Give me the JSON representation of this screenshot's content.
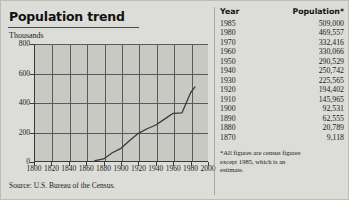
{
  "title": "Population trend",
  "source": "Source: U.S. Bureau of the Census.",
  "footnote": "*All figures are census figures except 1985, which is an estimate.",
  "table": {
    "headers": {
      "year": "Year",
      "population": "Population*"
    },
    "rows": [
      {
        "year": "1985",
        "population": "509,000"
      },
      {
        "year": "1980",
        "population": "469,557"
      },
      {
        "year": "1970",
        "population": "332,416"
      },
      {
        "year": "1960",
        "population": "330,066"
      },
      {
        "year": "1950",
        "population": "290,529"
      },
      {
        "year": "1940",
        "population": "250,742"
      },
      {
        "year": "1930",
        "population": "225,565"
      },
      {
        "year": "1920",
        "population": "194,402"
      },
      {
        "year": "1910",
        "population": "145,965"
      },
      {
        "year": "1900",
        "population": "92,531"
      },
      {
        "year": "1890",
        "population": "62,555"
      },
      {
        "year": "1880",
        "population": "20,789"
      },
      {
        "year": "1870",
        "population": "9,118"
      }
    ]
  },
  "chart_data": {
    "type": "line",
    "title": "Population trend",
    "xlabel": "",
    "ylabel": "Thousands",
    "xlim": [
      1800,
      2000
    ],
    "ylim": [
      0,
      800
    ],
    "xticks": [
      1800,
      1820,
      1840,
      1860,
      1880,
      1900,
      1920,
      1940,
      1960,
      1980,
      2000
    ],
    "yticks": [
      0,
      200,
      400,
      600,
      800
    ],
    "grid": true,
    "legend": false,
    "x": [
      1870,
      1880,
      1890,
      1900,
      1910,
      1920,
      1930,
      1940,
      1950,
      1960,
      1970,
      1980,
      1985
    ],
    "values": [
      9.118,
      20.789,
      62.555,
      92.531,
      145.965,
      194.402,
      225.565,
      250.742,
      290.529,
      330.066,
      332.416,
      469.557,
      509.0
    ],
    "series": [
      {
        "name": "Population (thousands)",
        "values": [
          9.118,
          20.789,
          62.555,
          92.531,
          145.965,
          194.402,
          225.565,
          250.742,
          290.529,
          330.066,
          332.416,
          469.557,
          509.0
        ]
      }
    ],
    "line_color": "#3a3a3a",
    "plot_background": "#c9c9c4"
  }
}
